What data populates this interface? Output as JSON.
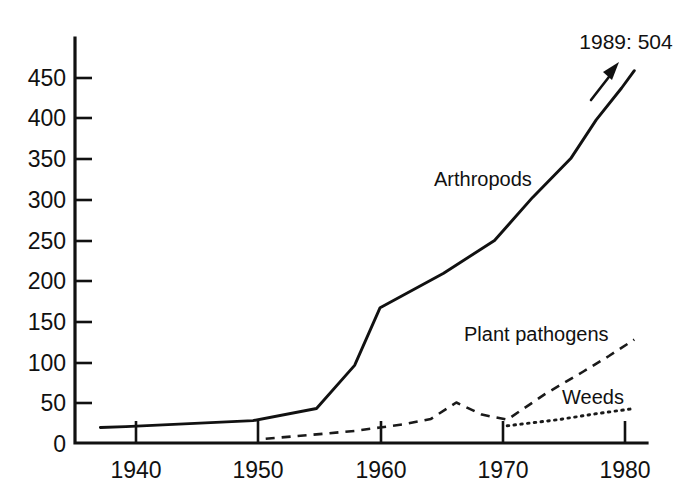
{
  "chart_data": {
    "type": "line",
    "title": "",
    "subtitle": "",
    "xlabel": "",
    "ylabel": "",
    "xlim": [
      1936,
      1981
    ],
    "ylim": [
      0,
      470
    ],
    "grid": false,
    "legend_position": "inline-labels",
    "x_ticks": [
      1940,
      1950,
      1960,
      1970,
      1980
    ],
    "x_tick_labels": [
      "1940",
      "1950",
      "1960",
      "1970",
      "1980"
    ],
    "y_ticks": [
      0,
      50,
      100,
      150,
      200,
      250,
      300,
      350,
      400,
      450
    ],
    "y_tick_labels": [
      "0",
      "50",
      "100",
      "150",
      "200",
      "250",
      "300",
      "350",
      "400",
      "450"
    ],
    "series": [
      {
        "name": "Arthropods",
        "line_style": "solid",
        "color": "#111111",
        "x": [
          1938,
          1940,
          1950,
          1955,
          1958,
          1960,
          1965,
          1969,
          1972,
          1975,
          1977,
          1979,
          1980
        ],
        "values": [
          18,
          19,
          26,
          40,
          90,
          157,
          197,
          235,
          285,
          330,
          375,
          412,
          432
        ]
      },
      {
        "name": "Plant pathogens",
        "line_style": "dashed",
        "color": "#1a1a1a",
        "x": [
          1951,
          1955,
          1958,
          1960,
          1962,
          1964,
          1966,
          1968,
          1970,
          1973,
          1976,
          1978,
          1980
        ],
        "values": [
          5,
          10,
          14,
          18,
          22,
          28,
          47,
          33,
          27,
          57,
          83,
          101,
          120
        ]
      },
      {
        "name": "Weeds",
        "line_style": "dotted",
        "color": "#1a1a1a",
        "x": [
          1970,
          1974,
          1977,
          1980
        ],
        "values": [
          20,
          27,
          34,
          40
        ]
      }
    ],
    "annotations": [
      {
        "name": "arthropods-1989-callout",
        "text": "1989: 504",
        "points_to_series": "Arthropods"
      }
    ]
  },
  "series_labels": {
    "arthropods": "Arthropods",
    "plant_pathogens": "Plant pathogens",
    "weeds": "Weeds"
  },
  "annotation": {
    "text": "1989: 504"
  },
  "axes": {
    "y_tick_labels": [
      "450",
      "400",
      "350",
      "300",
      "250",
      "200",
      "150",
      "100",
      "50",
      "0"
    ],
    "x_tick_labels": [
      "1940",
      "1950",
      "1960",
      "1970",
      "1980"
    ]
  },
  "colors": {
    "background": "#ffffff",
    "ink": "#111111"
  }
}
